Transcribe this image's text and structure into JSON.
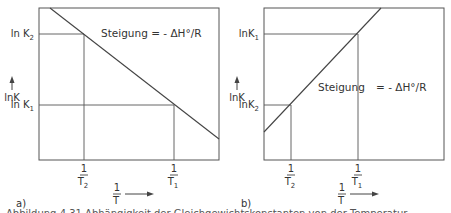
{
  "figure": {
    "panels": [
      {
        "id": "a",
        "label": "a)",
        "frame": {
          "x": 39,
          "y": 8,
          "w": 180,
          "h": 152
        },
        "y_axis_label": "lnK",
        "x_axis_label_num": "1",
        "x_axis_label_den": "T",
        "y_ticks": [
          {
            "text": "ln K",
            "sub": "2",
            "y": 34
          },
          {
            "text": "ln K",
            "sub": "1",
            "y": 105
          }
        ],
        "x_ticks": [
          {
            "num": "1",
            "den": "T",
            "sub": "2",
            "x": 84
          },
          {
            "num": "1",
            "den": "T",
            "sub": "1",
            "x": 174
          }
        ],
        "line": {
          "x1": 50,
          "y1": 8,
          "x2": 219,
          "y2": 139
        },
        "guides": [
          {
            "x1": 39,
            "y1": 34,
            "x2": 84,
            "y2": 34
          },
          {
            "x1": 84,
            "y1": 34,
            "x2": 84,
            "y2": 160
          },
          {
            "x1": 39,
            "y1": 105,
            "x2": 174,
            "y2": 105
          },
          {
            "x1": 174,
            "y1": 105,
            "x2": 174,
            "y2": 160
          }
        ],
        "slope_text": "Steigung = - ΔH°/R",
        "slope_pos": {
          "x": 101,
          "y": 37
        }
      },
      {
        "id": "b",
        "label": "b)",
        "frame": {
          "x": 264,
          "y": 8,
          "w": 180,
          "h": 152
        },
        "y_axis_label": "lnK",
        "x_axis_label_num": "1",
        "x_axis_label_den": "T",
        "y_ticks": [
          {
            "text": "lnK",
            "sub": "1",
            "y": 34
          },
          {
            "text": "lnK",
            "sub": "2",
            "y": 105
          }
        ],
        "x_ticks": [
          {
            "num": "1",
            "den": "T",
            "sub": "2",
            "x": 291
          },
          {
            "num": "1",
            "den": "T",
            "sub": "1",
            "x": 358
          }
        ],
        "line": {
          "x1": 264,
          "y1": 132,
          "x2": 381,
          "y2": 8
        },
        "guides": [
          {
            "x1": 264,
            "y1": 34,
            "x2": 358,
            "y2": 34
          },
          {
            "x1": 358,
            "y1": 34,
            "x2": 358,
            "y2": 160
          },
          {
            "x1": 264,
            "y1": 105,
            "x2": 291,
            "y2": 105
          },
          {
            "x1": 291,
            "y1": 105,
            "x2": 291,
            "y2": 160
          }
        ],
        "slope_text_left": "Steigung",
        "slope_text_right": "= - ΔH°/R",
        "slope_pos": {
          "x": 318,
          "y": 91
        }
      }
    ],
    "caption_partial": "Abbildung 4.31  Abhängigkeit der Gleichgewichtskonstanten von der Temperatur"
  }
}
